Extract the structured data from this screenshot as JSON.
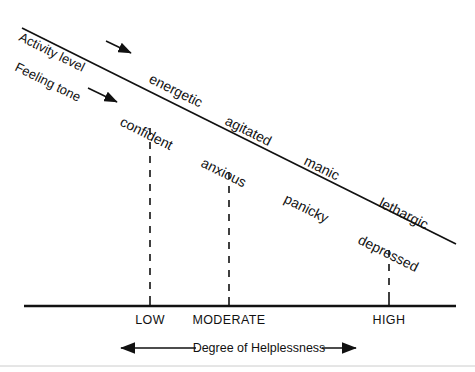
{
  "diagram": {
    "annotations": {
      "activity_level": "Activity level",
      "feeling_tone": "Feeling tone"
    },
    "activity_terms": [
      {
        "label": "energetic",
        "x": 182,
        "y": 78
      },
      {
        "label": "agitated",
        "x": 256,
        "y": 120
      },
      {
        "label": "manic",
        "x": 329,
        "y": 161
      },
      {
        "label": "lethargic",
        "x": 408,
        "y": 203
      }
    ],
    "feeling_terms": [
      {
        "label": "confident",
        "x": 152,
        "y": 120
      },
      {
        "label": "anxious",
        "x": 229,
        "y": 161
      },
      {
        "label": "panicky",
        "x": 311,
        "y": 199
      },
      {
        "label": "depressed",
        "x": 389,
        "y": 239
      }
    ],
    "axis": {
      "caption": "Degree of Helplessness",
      "ticks": [
        {
          "label": "LOW",
          "x": 150
        },
        {
          "label": "MODERATE",
          "x": 229
        },
        {
          "label": "HIGH",
          "x": 389
        }
      ]
    },
    "colors": {
      "ink": "#111111",
      "background": "#ffffff",
      "divider": "#cccccc"
    }
  }
}
